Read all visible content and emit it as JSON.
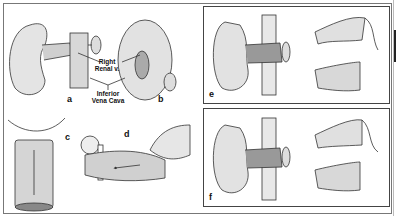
{
  "figure": {
    "panels": [
      {
        "id": "a",
        "label": "a"
      },
      {
        "id": "b",
        "label": "b"
      },
      {
        "id": "c",
        "label": "c"
      },
      {
        "id": "d",
        "label": "d"
      },
      {
        "id": "e",
        "label": "e"
      },
      {
        "id": "f",
        "label": "f"
      }
    ],
    "callouts": {
      "right_renal_vein": [
        "Right",
        "Renal v."
      ],
      "inferior_vena_cava": [
        "Inferior",
        "Vena Cava"
      ]
    },
    "colors": {
      "ink": "#222222",
      "frame": "#777777",
      "background": "#ffffff"
    }
  }
}
